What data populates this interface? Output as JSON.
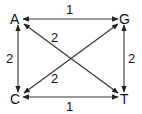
{
  "diagram": {
    "type": "weighted-graph",
    "nodes": [
      {
        "id": "A",
        "label": "A"
      },
      {
        "id": "G",
        "label": "G"
      },
      {
        "id": "C",
        "label": "C"
      },
      {
        "id": "T",
        "label": "T"
      }
    ],
    "edges": [
      {
        "from": "A",
        "to": "G",
        "weight": "1",
        "direction": "bidirectional"
      },
      {
        "from": "C",
        "to": "T",
        "weight": "1",
        "direction": "bidirectional"
      },
      {
        "from": "A",
        "to": "C",
        "weight": "2",
        "direction": "bidirectional"
      },
      {
        "from": "G",
        "to": "T",
        "weight": "2",
        "direction": "bidirectional"
      },
      {
        "from": "A",
        "to": "T",
        "weight": "2",
        "direction": "bidirectional"
      },
      {
        "from": "C",
        "to": "G",
        "weight": "2",
        "direction": "bidirectional"
      }
    ]
  }
}
